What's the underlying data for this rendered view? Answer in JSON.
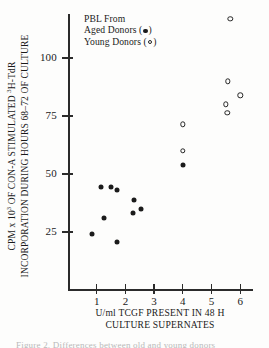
{
  "figure": {
    "legend": {
      "title": "PBL From",
      "aged_label_prefix": "Aged Donors (",
      "aged_label_suffix": ")",
      "young_label_prefix": "Young Donors (",
      "young_label_suffix": ")",
      "aged_marker": "filled-circle-icon",
      "young_marker": "open-circle-icon"
    },
    "axis_titles": {
      "y_line1_a": "CPM x 10",
      "y_line1_sup": "3",
      "y_line1_b": " OF CON-A STIMULATED ",
      "y_line1_sup2": "3",
      "y_line1_c": "H-TdR",
      "y_line2": "INCORPORATION DURING HOURS 68–72 OF CULTURE",
      "x_line1": "U/ml TCGF PRESENT IN 48 H",
      "x_line2": "CULTURE SUPERNATES"
    },
    "caption_fragment": "Figure 2.  Differences between old and young donors"
  },
  "chart_data": {
    "type": "scatter",
    "title": "",
    "xlabel": "U/ml TCGF PRESENT IN 48 H CULTURE SUPERNATES",
    "ylabel": "CPM x 10^3 OF CON-A STIMULATED 3H-TdR INCORPORATION DURING HOURS 68-72 OF CULTURE",
    "xlim": [
      0,
      6.6
    ],
    "ylim": [
      0,
      120
    ],
    "xticks": [
      1,
      2,
      3,
      4,
      5,
      6
    ],
    "yticks": [
      25,
      50,
      75,
      100
    ],
    "grid": false,
    "legend_position": "top-left-inside",
    "series": [
      {
        "name": "Aged Donors",
        "marker": "filled-circle",
        "color": "#1b1b1b",
        "points": [
          {
            "x": 0.85,
            "y": 24
          },
          {
            "x": 1.15,
            "y": 44.5
          },
          {
            "x": 1.25,
            "y": 31
          },
          {
            "x": 1.5,
            "y": 44.5
          },
          {
            "x": 1.7,
            "y": 43
          },
          {
            "x": 1.7,
            "y": 20.5
          },
          {
            "x": 2.25,
            "y": 33
          },
          {
            "x": 2.3,
            "y": 39
          },
          {
            "x": 2.55,
            "y": 35
          },
          {
            "x": 4.0,
            "y": 54
          }
        ]
      },
      {
        "name": "Young Donors",
        "marker": "open-circle",
        "color": "#242424",
        "points": [
          {
            "x": 4.0,
            "y": 71.5
          },
          {
            "x": 4.0,
            "y": 60
          },
          {
            "x": 5.5,
            "y": 80
          },
          {
            "x": 5.55,
            "y": 76.5
          },
          {
            "x": 5.57,
            "y": 90
          },
          {
            "x": 5.65,
            "y": 117
          },
          {
            "x": 6.0,
            "y": 84
          }
        ]
      }
    ]
  }
}
